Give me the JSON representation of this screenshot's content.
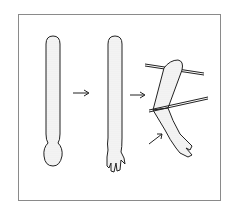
{
  "figure": {
    "type": "illustration",
    "steps": [
      {
        "label": "rolled-clay-cylinder"
      },
      {
        "label": "shaped-arm-with-hand"
      },
      {
        "label": "bent-arm-with-wires"
      }
    ],
    "arrows": 3,
    "colors": {
      "line": "#222222",
      "frame": "#8a8a8a",
      "background": "#ffffff",
      "shading": "#9a9a9a"
    }
  }
}
